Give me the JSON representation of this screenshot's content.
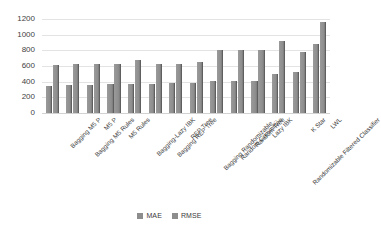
{
  "title_partial": "",
  "legend": {
    "position": "bottom-center",
    "items": [
      {
        "label": "MAE",
        "color": "#8d8d8d"
      },
      {
        "label": "RMSE",
        "color": "#8d8d8d"
      }
    ]
  },
  "axis": {
    "y_ticks": [
      "1200",
      "1000",
      "800",
      "600",
      "400",
      "200",
      "0"
    ],
    "y_min": 0,
    "y_max": 1200,
    "y_step": 200
  },
  "chart_data": {
    "type": "bar",
    "title": "",
    "xlabel": "",
    "ylabel": "",
    "ylim": [
      0,
      1200
    ],
    "ytick_step": 200,
    "grid": true,
    "legend_position": "bottom-center",
    "orientation": "vertical",
    "grouping": "grouped",
    "categories": [
      "Bagging M5 P",
      "Bagging M5 Rules",
      "M5 P",
      "M5 Rules",
      "Bagging-Lazy IBK",
      "Bagging REP Tree",
      "REP Tree",
      "Bagging Randomizable...",
      "Random Committee",
      "Random Tree",
      "Lazy IBK",
      "Randomizable Filtered Classifier",
      "K Star",
      "LWL"
    ],
    "series": [
      {
        "name": "MAE",
        "color": "#8d8d8d",
        "values": [
          350,
          355,
          360,
          365,
          375,
          365,
          380,
          385,
          415,
          410,
          405,
          500,
          525,
          880
        ]
      },
      {
        "name": "RMSE",
        "color": "#8d8d8d",
        "values": [
          615,
          620,
          625,
          625,
          680,
          620,
          620,
          655,
          800,
          800,
          800,
          920,
          775,
          1160
        ]
      }
    ]
  }
}
